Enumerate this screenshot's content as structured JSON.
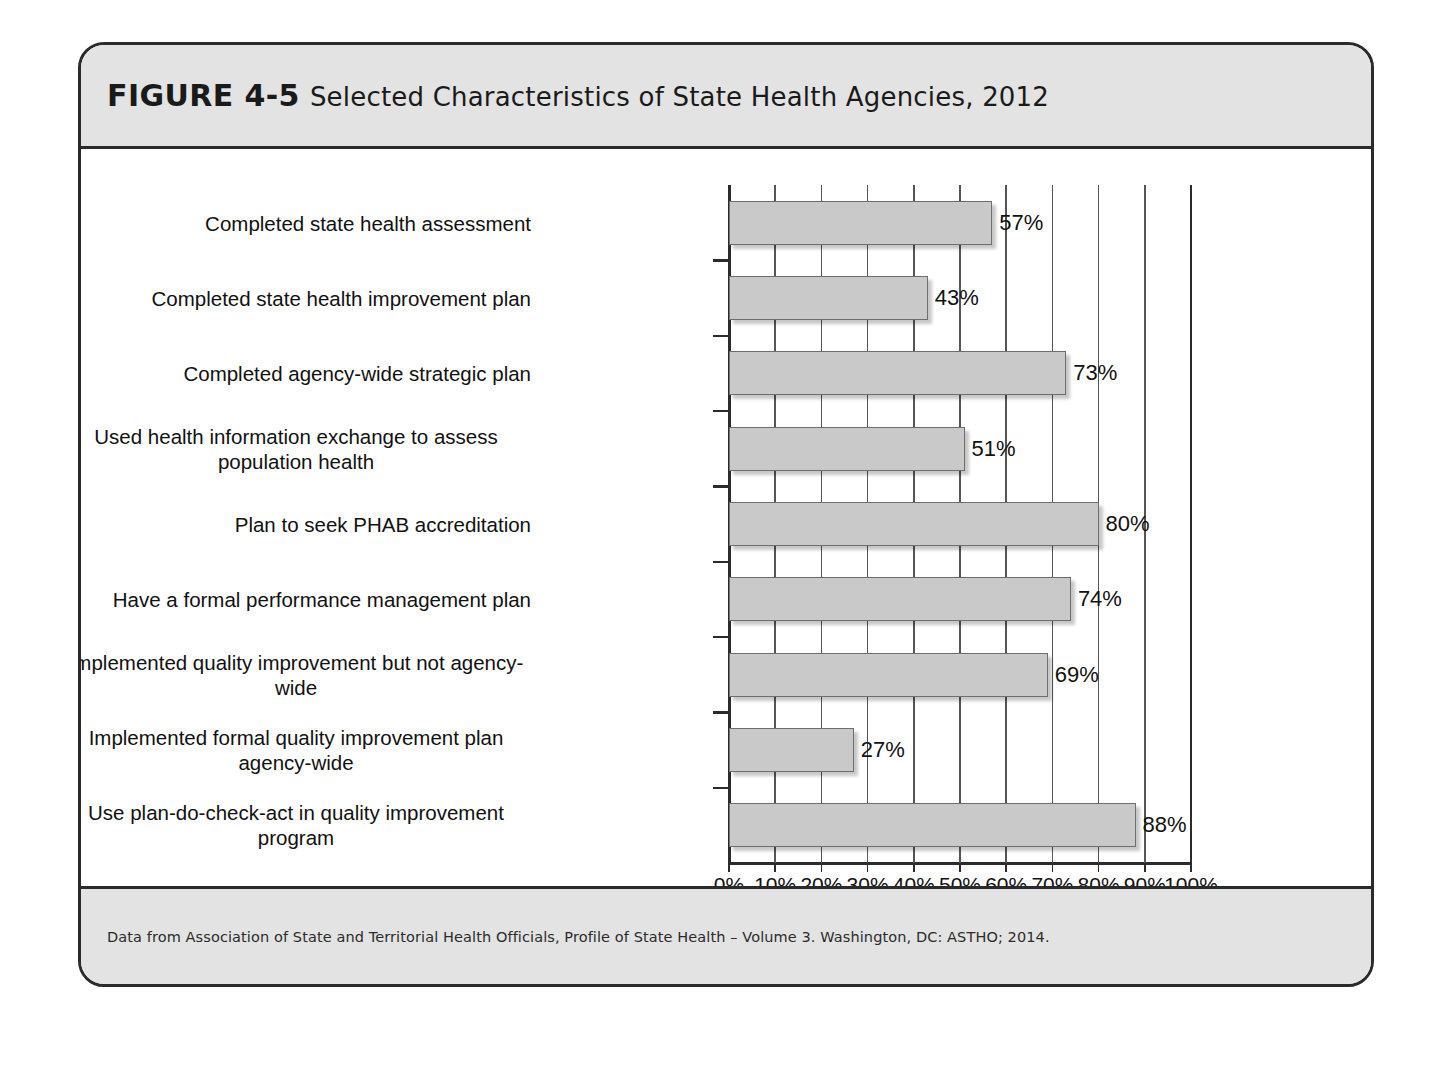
{
  "figure": {
    "number": "FIGURE 4-5",
    "title": "Selected Characteristics of State Health Agencies, 2012",
    "source_note": "Data from Association of State and Territorial Health Officials, Profile of State Health – Volume 3. Washington, DC: ASTHO; 2014."
  },
  "chart_data": {
    "type": "bar",
    "orientation": "horizontal",
    "title": "Selected Characteristics of State Health Agencies, 2012",
    "xlabel": "",
    "ylabel": "",
    "xlim": [
      0,
      100
    ],
    "xtick_labels": [
      "0%",
      "10%",
      "20%",
      "30%",
      "40%",
      "50%",
      "60%",
      "70%",
      "80%",
      "90%",
      "100%"
    ],
    "xtick_values": [
      0,
      10,
      20,
      30,
      40,
      50,
      60,
      70,
      80,
      90,
      100
    ],
    "grid": true,
    "grid_axis": "x",
    "legend": false,
    "bar_fill_color": "#c9c9c9",
    "bar_border_color": "#6e6e6e",
    "categories": [
      "Completed state health assessment",
      "Completed state health improvement plan",
      "Completed agency-wide strategic plan",
      "Used health information exchange to assess population health",
      "Plan to seek PHAB accreditation",
      "Have a formal performance management plan",
      "Implemented quality improvement but not agency-wide",
      "Implemented formal quality improvement plan agency-wide",
      "Use plan-do-check-act in quality improvement program"
    ],
    "category_lines": [
      [
        "Completed state health assessment"
      ],
      [
        "Completed state health improvement plan"
      ],
      [
        "Completed agency-wide strategic plan"
      ],
      [
        "Used health information exchange to assess",
        "population health"
      ],
      [
        "Plan to seek PHAB accreditation"
      ],
      [
        "Have a formal performance management plan"
      ],
      [
        "Implemented quality improvement but not agency-",
        "wide"
      ],
      [
        "Implemented formal quality improvement plan",
        "agency-wide"
      ],
      [
        "Use plan-do-check-act in quality improvement",
        "program"
      ]
    ],
    "values": [
      57,
      43,
      73,
      51,
      80,
      74,
      69,
      27,
      88
    ],
    "value_labels": [
      "57%",
      "43%",
      "73%",
      "51%",
      "80%",
      "74%",
      "69%",
      "27%",
      "88%"
    ]
  }
}
